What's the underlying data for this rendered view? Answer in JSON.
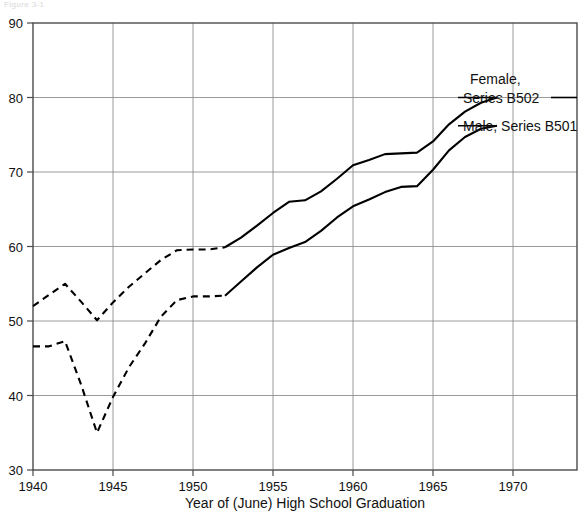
{
  "figure": {
    "top_stub_text": "Figure 3-1",
    "plot": {
      "left": 33,
      "right": 577,
      "top": 23,
      "bottom": 470
    }
  },
  "chart_data": {
    "type": "line",
    "title": "",
    "subtitle": "",
    "xlabel": "Year of (June) High School Graduation",
    "ylabel": "",
    "xlim": [
      1940,
      1974
    ],
    "ylim": [
      30,
      90
    ],
    "grid": true,
    "grid_axes": "both",
    "legend_position": "inline-right",
    "xticks": [
      1940,
      1945,
      1950,
      1955,
      1960,
      1965,
      1970
    ],
    "xtick_labels": [
      "1940",
      "1945",
      "1950",
      "1955",
      "1960",
      "1965",
      "1970"
    ],
    "yticks": [
      30,
      40,
      50,
      60,
      70,
      80,
      90
    ],
    "ytick_labels": [
      "30",
      "40",
      "50",
      "60",
      "70",
      "80",
      "90"
    ],
    "series": [
      {
        "name": "Female, Series B502",
        "label": "Female,\nSeries B502",
        "label_line1": "Female,",
        "label_line2": "Series B502",
        "color": "#000000",
        "x": [
          1940,
          1941,
          1942,
          1943,
          1944,
          1945,
          1946,
          1947,
          1948,
          1949,
          1950,
          1951,
          1952,
          1953,
          1954,
          1955,
          1956,
          1957,
          1958,
          1959,
          1960,
          1961,
          1962,
          1963,
          1964,
          1965,
          1966,
          1967,
          1968,
          1969
        ],
        "values": [
          52.0,
          53.5,
          55.0,
          52.6,
          50.1,
          52.5,
          54.6,
          56.4,
          58.2,
          59.5,
          59.6,
          59.6,
          59.9,
          61.2,
          62.8,
          64.5,
          66.0,
          66.2,
          67.4,
          69.1,
          70.9,
          71.6,
          72.4,
          72.5,
          72.6,
          74.1,
          76.4,
          78.1,
          79.3,
          80.0
        ],
        "dashed_through": 1952,
        "dash_note": "Dashed from 1940 to 1952, solid from 1952 to 1969"
      },
      {
        "name": "Male, Series B501",
        "label": "Male, Series B501",
        "label_line1": "Male, Series B501",
        "color": "#000000",
        "x": [
          1940,
          1941,
          1942,
          1943,
          1944,
          1945,
          1946,
          1947,
          1948,
          1949,
          1950,
          1951,
          1952,
          1953,
          1954,
          1955,
          1956,
          1957,
          1958,
          1959,
          1960,
          1961,
          1962,
          1963,
          1964,
          1965,
          1966,
          1967,
          1968,
          1969
        ],
        "values": [
          46.6,
          46.6,
          47.3,
          41.5,
          35.0,
          39.8,
          43.8,
          47.0,
          50.6,
          52.8,
          53.3,
          53.3,
          53.4,
          55.3,
          57.2,
          58.9,
          59.8,
          60.6,
          62.1,
          63.9,
          65.4,
          66.3,
          67.3,
          68.0,
          68.1,
          70.3,
          72.9,
          74.7,
          75.8,
          76.2
        ],
        "dashed_through": 1952,
        "dash_note": "Dashed from 1940 to 1952, solid from 1952 to 1969"
      }
    ],
    "annotations": [
      {
        "name": "female-leader-line",
        "text": "Female, Series B502",
        "from_x": 1969,
        "from_y": 80.0
      },
      {
        "name": "male-leader-line",
        "text": "Male, Series B501",
        "from_x": 1969,
        "from_y": 76.2
      }
    ]
  }
}
